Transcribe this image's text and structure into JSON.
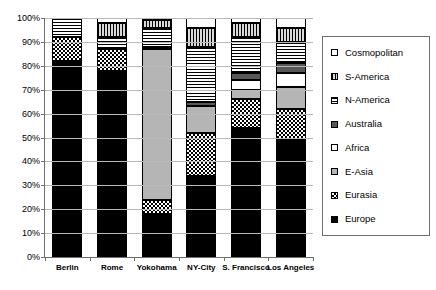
{
  "chart_data": {
    "type": "bar",
    "subtype": "stacked-percentage",
    "title": "",
    "xlabel": "",
    "ylabel": "",
    "ylim": [
      0,
      100
    ],
    "ytick_labels": [
      "0%",
      "10%",
      "20%",
      "30%",
      "40%",
      "50%",
      "60%",
      "70%",
      "80%",
      "90%",
      "100%"
    ],
    "ytick_values": [
      0,
      10,
      20,
      30,
      40,
      50,
      60,
      70,
      80,
      90,
      100
    ],
    "grid": true,
    "legend_position": "right",
    "categories": [
      "Berlin",
      "Rome",
      "Yokohama",
      "NY-City",
      "S. Francisco",
      "Los Angeles"
    ],
    "series": [
      {
        "name": "Europe",
        "pattern": "solid-black",
        "values": [
          82,
          78,
          18,
          34,
          54,
          49
        ]
      },
      {
        "name": "Eurasia",
        "pattern": "checkerboard",
        "values": [
          10,
          9,
          6,
          18,
          12,
          13
        ]
      },
      {
        "name": "E-Asia",
        "pattern": "solid-gray",
        "values": [
          0,
          0,
          63,
          11,
          4,
          9
        ]
      },
      {
        "name": "Africa",
        "pattern": "solid-white",
        "values": [
          0,
          0,
          0,
          0,
          4,
          6
        ]
      },
      {
        "name": "Australia",
        "pattern": "dark-gray",
        "values": [
          0,
          0,
          1,
          2,
          3,
          4
        ]
      },
      {
        "name": "N-America",
        "pattern": "horizontal-lines",
        "values": [
          8,
          5,
          8,
          23,
          15,
          9
        ]
      },
      {
        "name": "S-America",
        "pattern": "vertical-lines",
        "values": [
          0,
          6,
          3,
          8,
          6,
          6
        ]
      },
      {
        "name": "Cosmopolitan",
        "pattern": "white",
        "values": [
          0,
          2,
          1,
          4,
          2,
          4
        ]
      }
    ],
    "legend_entries": [
      {
        "label": "Cosmopolitan",
        "pattern": "white"
      },
      {
        "label": "S-America",
        "pattern": "vertical-lines"
      },
      {
        "label": "N-America",
        "pattern": "horizontal-lines"
      },
      {
        "label": "Australia",
        "pattern": "dark-gray"
      },
      {
        "label": "Africa",
        "pattern": "solid-white"
      },
      {
        "label": "E-Asia",
        "pattern": "solid-gray"
      },
      {
        "label": "Eurasia",
        "pattern": "checkerboard"
      },
      {
        "label": "Europe",
        "pattern": "solid-black"
      }
    ],
    "colors": {
      "europe": "#000000",
      "eurasia": "#000000",
      "e_asia": "#b5b5b5",
      "africa": "#ffffff",
      "australia": "#585858",
      "n_america": "#000000",
      "s_america": "#d9d9d9",
      "cosmopolitan": "#ffffff",
      "axis": "#6f6f6f",
      "grid": "#b9b9b9"
    }
  }
}
